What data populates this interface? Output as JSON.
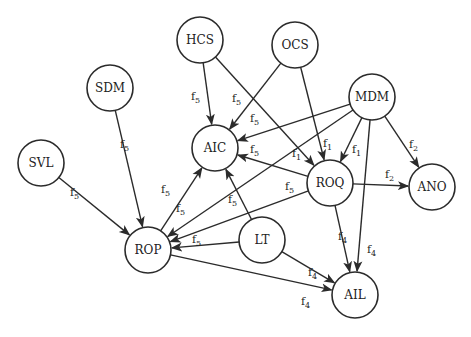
{
  "diagram": {
    "type": "directed-graph",
    "node_radius": 23,
    "colors": {
      "stroke": "#2b2b2b",
      "fill": "#ffffff",
      "text": "#222222"
    },
    "nodes": [
      {
        "id": "HCS",
        "label": "HCS",
        "x": 200,
        "y": 40
      },
      {
        "id": "OCS",
        "label": "OCS",
        "x": 295,
        "y": 45
      },
      {
        "id": "SDM",
        "label": "SDM",
        "x": 110,
        "y": 88
      },
      {
        "id": "MDM",
        "label": "MDM",
        "x": 372,
        "y": 97
      },
      {
        "id": "SVL",
        "label": "SVL",
        "x": 41,
        "y": 163
      },
      {
        "id": "AIC",
        "label": "AIC",
        "x": 215,
        "y": 148
      },
      {
        "id": "ROQ",
        "label": "ROQ",
        "x": 330,
        "y": 183
      },
      {
        "id": "ANO",
        "label": "ANO",
        "x": 432,
        "y": 187
      },
      {
        "id": "ROP",
        "label": "ROP",
        "x": 148,
        "y": 250
      },
      {
        "id": "LT",
        "label": "LT",
        "x": 262,
        "y": 240
      },
      {
        "id": "AIL",
        "label": "AIL",
        "x": 355,
        "y": 295
      }
    ],
    "edges": [
      {
        "from": "HCS",
        "to": "AIC",
        "label": "f",
        "sub": "5",
        "lx": 191,
        "ly": 100
      },
      {
        "from": "HCS",
        "to": "ROQ",
        "label": "f",
        "sub": "1",
        "lx": 292,
        "ly": 157
      },
      {
        "from": "OCS",
        "to": "AIC",
        "label": "f",
        "sub": "5",
        "lx": 232,
        "ly": 102
      },
      {
        "from": "OCS",
        "to": "ROQ",
        "label": "f",
        "sub": "1",
        "lx": 323,
        "ly": 147
      },
      {
        "from": "MDM",
        "to": "AIC",
        "label": "f",
        "sub": "5",
        "lx": 250,
        "ly": 122
      },
      {
        "from": "MDM",
        "to": "ROQ",
        "label": "f",
        "sub": "1",
        "lx": 352,
        "ly": 153
      },
      {
        "from": "MDM",
        "to": "ROP",
        "label": "f",
        "sub": "5",
        "lx": 176,
        "ly": 212
      },
      {
        "from": "MDM",
        "to": "ANO",
        "label": "f",
        "sub": "2",
        "lx": 409,
        "ly": 148
      },
      {
        "from": "MDM",
        "to": "AIL",
        "label": "f",
        "sub": "4",
        "lx": 367,
        "ly": 253
      },
      {
        "from": "SDM",
        "to": "ROP",
        "label": "f",
        "sub": "5",
        "lx": 120,
        "ly": 148
      },
      {
        "from": "SVL",
        "to": "ROP",
        "label": "f",
        "sub": "5",
        "lx": 70,
        "ly": 196
      },
      {
        "from": "ROP",
        "to": "AIC",
        "label": "f",
        "sub": "5",
        "lx": 161,
        "ly": 193
      },
      {
        "from": "ROQ",
        "to": "AIC",
        "label": "f",
        "sub": "5",
        "lx": 250,
        "ly": 153
      },
      {
        "from": "ROQ",
        "to": "ROP",
        "label": "f",
        "sub": "5",
        "lx": 285,
        "ly": 190
      },
      {
        "from": "ROQ",
        "to": "ANO",
        "label": "f",
        "sub": "2",
        "lx": 385,
        "ly": 178
      },
      {
        "from": "ROQ",
        "to": "AIL",
        "label": "f",
        "sub": "4",
        "lx": 338,
        "ly": 240
      },
      {
        "from": "LT",
        "to": "AIC",
        "label": "f",
        "sub": "5",
        "lx": 228,
        "ly": 203
      },
      {
        "from": "LT",
        "to": "ROP",
        "label": "f",
        "sub": "5",
        "lx": 192,
        "ly": 243
      },
      {
        "from": "LT",
        "to": "AIL",
        "label": "f",
        "sub": "4",
        "lx": 308,
        "ly": 276
      },
      {
        "from": "ROP",
        "to": "AIL",
        "label": "f",
        "sub": "4",
        "lx": 301,
        "ly": 305
      }
    ]
  }
}
